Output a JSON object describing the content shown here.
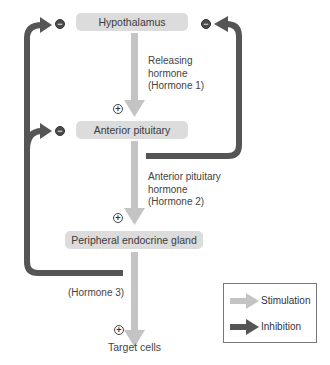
{
  "nodes": {
    "hypothalamus": "Hypothalamus",
    "anterior_pituitary": "Anterior pituitary",
    "peripheral_gland": "Peripheral endocrine gland",
    "target_cells": "Target cells"
  },
  "hormones": {
    "h1_line1": "Releasing",
    "h1_line2": "hormone",
    "h1_line3": "(Hormone 1)",
    "h2_line1": "Anterior pituitary",
    "h2_line2": "hormone",
    "h2_line3": "(Hormone 2)",
    "h3": "(Hormone 3)"
  },
  "signs": {
    "plus": "+",
    "minus": "−"
  },
  "legend": {
    "stimulation": "Stimulation",
    "inhibition": "Inhibition"
  },
  "colors": {
    "stimulation": "#c4c4c4",
    "inhibition": "#555555",
    "box": "#dcdcdc"
  }
}
